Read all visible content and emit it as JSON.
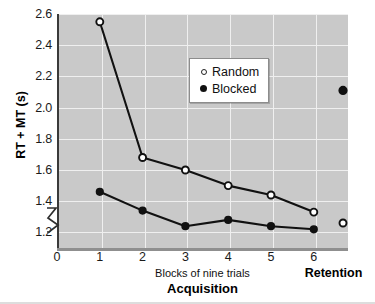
{
  "chart_data": {
    "type": "line",
    "title": "",
    "xlabel": "Blocks of nine trials",
    "xlabel_main": "Acquisition",
    "ylabel": "RT + MT (s)",
    "retention_label": "Retention",
    "x": [
      1,
      2,
      3,
      4,
      5,
      6
    ],
    "xticks": [
      "0",
      "1",
      "2",
      "3",
      "4",
      "5",
      "6"
    ],
    "yticks": [
      "1.2",
      "1.4",
      "1.6",
      "1.8",
      "2.0",
      "2.2",
      "2.4",
      "2.6"
    ],
    "ylim": [
      1.1,
      2.6
    ],
    "xlim": [
      0,
      6.8
    ],
    "grid": true,
    "axis_break": true,
    "legend_position": "upper-center-right",
    "series": [
      {
        "name": "Random",
        "marker": "open-circle",
        "values": [
          2.55,
          1.68,
          1.6,
          1.5,
          1.44,
          1.33
        ],
        "retention_value": 1.26
      },
      {
        "name": "Blocked",
        "marker": "filled-circle",
        "values": [
          1.46,
          1.34,
          1.24,
          1.28,
          1.24,
          1.22
        ],
        "retention_value": 2.11
      }
    ]
  },
  "legend": {
    "items": [
      {
        "label": "Random",
        "marker": "open-circle"
      },
      {
        "label": "Blocked",
        "marker": "filled-circle"
      }
    ]
  },
  "colors": {
    "plot_background": "#c9c9c9",
    "gridline": "#efefef",
    "axis": "#3a3a3a",
    "series": "#111111",
    "page_background": "#ffffff"
  }
}
